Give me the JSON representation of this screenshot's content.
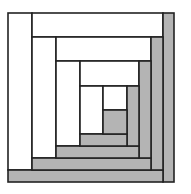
{
  "diagram": {
    "type": "log-cabin-quilt-block",
    "colors": {
      "light": "#ffffff",
      "dark": "#b4b4b4",
      "stroke": "#222222",
      "background": "#ffffff"
    },
    "stroke_width": 1.6,
    "pieces": [
      {
        "id": "round1-left",
        "tone": "light",
        "x": 8,
        "y": 13,
        "w": 24,
        "h": 157
      },
      {
        "id": "round1-top",
        "tone": "light",
        "x": 32,
        "y": 13,
        "w": 131,
        "h": 24
      },
      {
        "id": "round1-right",
        "tone": "dark",
        "x": 163,
        "y": 13,
        "w": 11,
        "h": 169
      },
      {
        "id": "round1-bottom",
        "tone": "dark",
        "x": 8,
        "y": 170,
        "w": 155,
        "h": 12
      },
      {
        "id": "round2-left",
        "tone": "light",
        "x": 32,
        "y": 37,
        "w": 24,
        "h": 121
      },
      {
        "id": "round2-top",
        "tone": "light",
        "x": 56,
        "y": 37,
        "w": 95,
        "h": 24
      },
      {
        "id": "round2-right",
        "tone": "dark",
        "x": 151,
        "y": 37,
        "w": 12,
        "h": 133
      },
      {
        "id": "round2-bottom",
        "tone": "dark",
        "x": 32,
        "y": 158,
        "w": 119,
        "h": 12
      },
      {
        "id": "round3-left",
        "tone": "light",
        "x": 56,
        "y": 61,
        "w": 24,
        "h": 85
      },
      {
        "id": "round3-top",
        "tone": "light",
        "x": 80,
        "y": 61,
        "w": 59,
        "h": 25
      },
      {
        "id": "round3-right",
        "tone": "dark",
        "x": 139,
        "y": 61,
        "w": 12,
        "h": 97
      },
      {
        "id": "round3-bottom",
        "tone": "dark",
        "x": 56,
        "y": 146,
        "w": 83,
        "h": 12
      },
      {
        "id": "round4-left",
        "tone": "light",
        "x": 80,
        "y": 86,
        "w": 23,
        "h": 48
      },
      {
        "id": "round4-top",
        "tone": "light",
        "x": 103,
        "y": 86,
        "w": 24,
        "h": 24
      },
      {
        "id": "round4-right",
        "tone": "dark",
        "x": 127,
        "y": 86,
        "w": 12,
        "h": 60
      },
      {
        "id": "round4-bottom",
        "tone": "dark",
        "x": 80,
        "y": 134,
        "w": 47,
        "h": 12
      },
      {
        "id": "center",
        "tone": "dark",
        "x": 103,
        "y": 110,
        "w": 24,
        "h": 24
      }
    ]
  }
}
